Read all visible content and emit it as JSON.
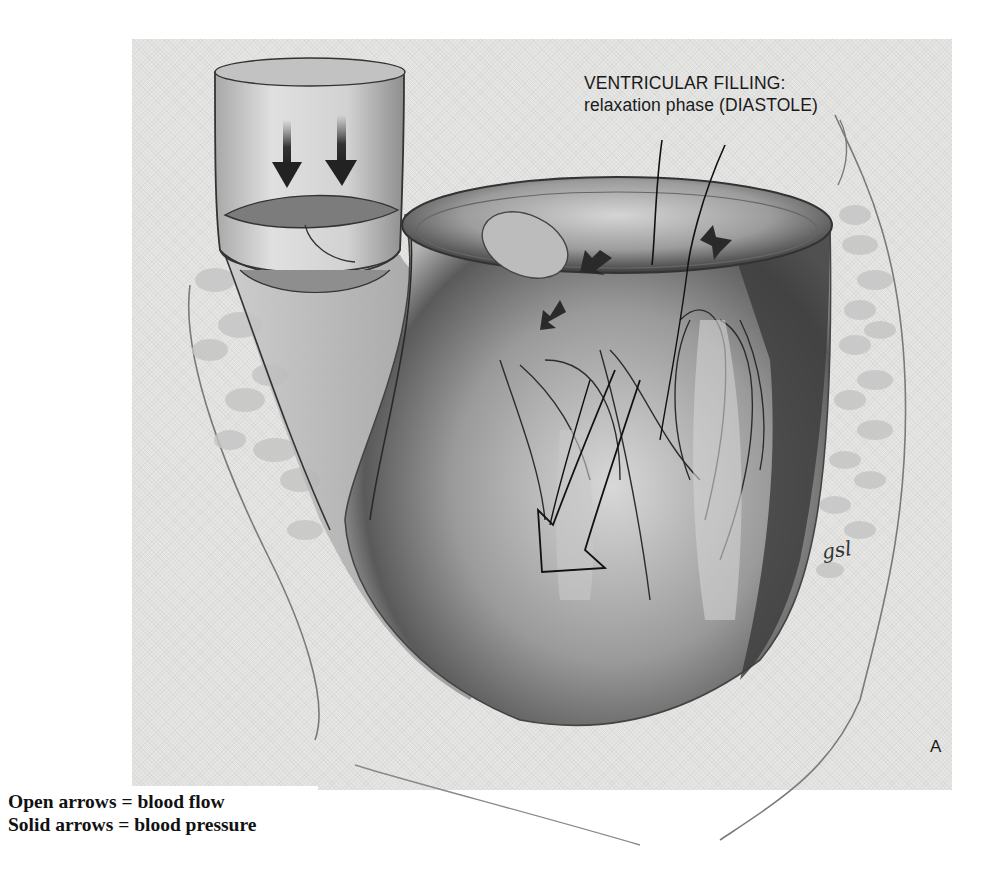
{
  "figure": {
    "title_line1": "VENTRICULAR FILLING:",
    "title_line2": "relaxation phase (DIASTOLE)",
    "panel_label": "A",
    "artist_signature": "gsl"
  },
  "legend": {
    "items": [
      {
        "label": "Open arrows = blood flow"
      },
      {
        "label": "Solid arrows = blood pressure"
      }
    ]
  },
  "colors": {
    "panel_background": "#e6e6e4",
    "ink": "#1a1a1a",
    "page_background": "#ffffff"
  }
}
